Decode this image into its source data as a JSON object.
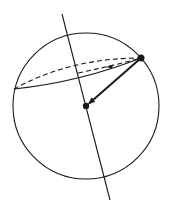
{
  "diagram": {
    "colors": {
      "stroke": "#1a1a1a",
      "background": "#ffffff"
    },
    "sphere": {
      "cx": 86,
      "cy": 106,
      "r": 73
    },
    "axis": {
      "x1": 62,
      "y1": 14,
      "x2": 110,
      "y2": 200
    },
    "center_point": {
      "x": 86,
      "y": 106,
      "r": 3.2
    },
    "surface_point": {
      "x": 141,
      "y": 58,
      "r": 3.5
    },
    "vector": {
      "from": [
        141,
        58
      ],
      "to": [
        88,
        104
      ],
      "label": ""
    },
    "orbit_left_point": {
      "x": 14,
      "y": 89
    }
  }
}
